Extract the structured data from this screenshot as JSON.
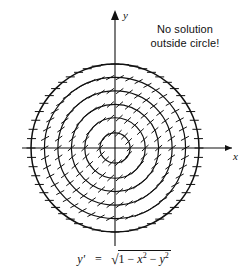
{
  "figure": {
    "background_color": "#ffffff",
    "ink_color": "#111111"
  },
  "annotation": {
    "line1": "No solution",
    "line2": "outside circle!"
  },
  "axes": {
    "x_label": "x",
    "y_label": "y",
    "origin_px": [
      115,
      148
    ],
    "x_axis_y_px": 148,
    "y_axis_x_px": 115
  },
  "caption": {
    "lhs": "y'",
    "equals": "=",
    "radical_symbol": "√",
    "radicand_prefix": "1 − ",
    "var_x": "x",
    "exp_x": "2",
    "minus": " − ",
    "var_y": "y",
    "exp_y": "2",
    "full_text": "y' = √(1 − x² − y²)"
  },
  "chart_data": {
    "type": "line",
    "xlabel": "x",
    "ylabel": "y",
    "xlim": [
      -1.45,
      1.45
    ],
    "ylim": [
      -1.45,
      1.45
    ],
    "grid": false,
    "legend": null,
    "domain_note": "No solution outside circle!",
    "equation": "y' = sqrt(1 - x^2 - y^2)",
    "center": [
      0,
      0
    ],
    "boundary_circle_radius": 1.0,
    "isocline_circles": [
      {
        "radius": 0.18,
        "slope": 0.98
      },
      {
        "radius": 0.36,
        "slope": 0.93
      },
      {
        "radius": 0.52,
        "slope": 0.85
      },
      {
        "radius": 0.68,
        "slope": 0.73
      },
      {
        "radius": 0.84,
        "slope": 0.54
      },
      {
        "radius": 1.0,
        "slope": 0.0
      }
    ],
    "lineal_elements": {
      "description": "Short tangent dashes drawn along each isocline circle; slope constant on each circle, equal to sqrt(1 - r^2)",
      "dash_length_px": 9,
      "counts_per_circle": [
        14,
        22,
        30,
        38,
        46,
        56
      ]
    },
    "solution_curves": [
      {
        "name": "curve-1",
        "start": [
          -1.0,
          -0.22
        ],
        "end": [
          0.42,
          1.0
        ]
      },
      {
        "name": "curve-2",
        "start": [
          -0.72,
          -1.0
        ],
        "end": [
          1.0,
          0.52
        ]
      },
      {
        "name": "curve-3",
        "start": [
          -0.28,
          -1.0
        ],
        "end": [
          1.0,
          0.02
        ]
      },
      {
        "name": "curve-4",
        "start": [
          -1.0,
          0.46
        ],
        "end": [
          0.05,
          1.0
        ]
      },
      {
        "name": "curve-5",
        "start": [
          0.18,
          -1.0
        ],
        "end": [
          1.0,
          -0.38
        ]
      }
    ]
  }
}
